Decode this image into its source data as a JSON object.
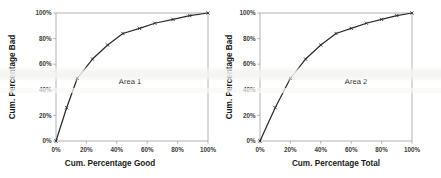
{
  "figure": {
    "background": "#ffffff",
    "panel_count": 2
  },
  "chart_data": [
    {
      "type": "line",
      "title": "",
      "xlabel": "Cum. Percentage Good",
      "ylabel": "Cum. Percentage Bad",
      "annotation": "Area 1",
      "xlim": [
        0,
        100
      ],
      "ylim": [
        0,
        100
      ],
      "xticks": [
        "0%",
        "20%",
        "40%",
        "60%",
        "80%",
        "100%"
      ],
      "yticks": [
        "0%",
        "20%",
        "40%",
        "60%",
        "80%",
        "100%"
      ],
      "xtick_values": [
        0,
        20,
        40,
        60,
        80,
        100
      ],
      "ytick_values": [
        0,
        20,
        40,
        60,
        80,
        100
      ],
      "grid": false,
      "legend": "none",
      "line_color": "#2b2b2b",
      "marker": "tick",
      "series": [
        {
          "name": "Cumulative bad vs good",
          "x": [
            0,
            7,
            14,
            24,
            34,
            44,
            55,
            65,
            77,
            88,
            100
          ],
          "y": [
            0,
            26,
            49,
            64,
            75,
            84,
            88,
            92,
            95,
            98,
            100
          ]
        }
      ]
    },
    {
      "type": "line",
      "title": "",
      "xlabel": "Cum. Percentage Total",
      "ylabel": "Cum. Percentage Bad",
      "annotation": "Area 2",
      "xlim": [
        0,
        100
      ],
      "ylim": [
        0,
        100
      ],
      "xticks": [
        "0%",
        "20%",
        "40%",
        "60%",
        "80%",
        "100%"
      ],
      "yticks": [
        "0%",
        "20%",
        "40%",
        "60%",
        "80%",
        "100%"
      ],
      "xtick_values": [
        0,
        20,
        40,
        60,
        80,
        100
      ],
      "ytick_values": [
        0,
        20,
        40,
        60,
        80,
        100
      ],
      "grid": false,
      "legend": "none",
      "line_color": "#2b2b2b",
      "marker": "tick",
      "series": [
        {
          "name": "Cumulative bad vs total",
          "x": [
            0,
            10,
            20,
            30,
            40,
            50,
            60,
            70,
            80,
            90,
            100
          ],
          "y": [
            0,
            26,
            49,
            64,
            75,
            84,
            88,
            92,
            95,
            98,
            100
          ]
        }
      ]
    }
  ]
}
